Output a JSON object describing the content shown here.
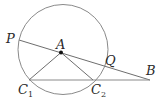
{
  "diagram": {
    "title": "",
    "circle": {
      "cx": 63,
      "cy": 49.5,
      "r": 45,
      "stroke": "#8a8a8a"
    },
    "points": {
      "P": {
        "x": 19,
        "y": 40
      },
      "A": {
        "x": 61,
        "y": 52.5
      },
      "Q": {
        "x": 102,
        "y": 64.5
      },
      "B": {
        "x": 150,
        "y": 80
      },
      "C1": {
        "x": 29,
        "y": 80
      },
      "C2": {
        "x": 93,
        "y": 80
      }
    },
    "segments": [
      [
        "P",
        "B"
      ],
      [
        "C1",
        "B"
      ],
      [
        "A",
        "C1"
      ],
      [
        "A",
        "C2"
      ]
    ],
    "labels": {
      "P": "P",
      "A": "A",
      "Q": "Q",
      "B": "B",
      "C1_main": "C",
      "C1_sub": "1",
      "C2_main": "C",
      "C2_sub": "2"
    },
    "line_color": "#6e6e6e",
    "label_color": "#2a2a2a"
  }
}
